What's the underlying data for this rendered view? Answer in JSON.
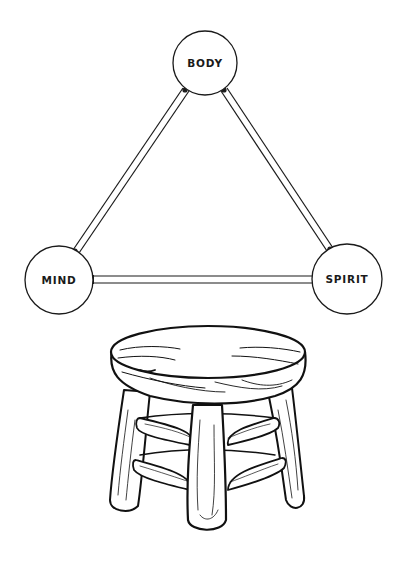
{
  "diagram": {
    "title": "",
    "nodes": [
      {
        "id": "body",
        "label": "BODY",
        "cx": 205,
        "cy": 63,
        "r": 32
      },
      {
        "id": "mind",
        "label": "MIND",
        "cx": 59,
        "cy": 280,
        "r": 34
      },
      {
        "id": "spirit",
        "label": "SPIRIT",
        "cx": 347,
        "cy": 279,
        "r": 35
      }
    ],
    "edges": [
      {
        "from": "body",
        "to": "mind"
      },
      {
        "from": "body",
        "to": "spirit"
      },
      {
        "from": "mind",
        "to": "spirit"
      }
    ],
    "colors": {
      "stroke": "#1a1a1a",
      "fill": "#ffffff"
    },
    "illustration": {
      "subject": "three-legged wooden stool",
      "icon": "stool-icon"
    }
  }
}
